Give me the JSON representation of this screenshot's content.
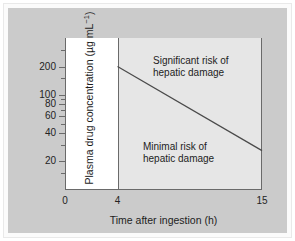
{
  "chart_data": {
    "type": "line",
    "title": "",
    "subtitle": "",
    "xlabel": "Time after ingestion (h)",
    "ylabel": "Plasma drug concentration (µg mL⁻¹)",
    "ylabel_plain": "Plasma drug concentration (ugmL-1)",
    "yscale": "log",
    "xscale": "linear",
    "xlim": [
      0,
      15
    ],
    "ylim": [
      10,
      400
    ],
    "grid": false,
    "legend": null,
    "xticks": [
      {
        "value": 0,
        "label": "0"
      },
      {
        "value": 4,
        "label": "4"
      },
      {
        "value": 15,
        "label": "15"
      }
    ],
    "yticks": [
      {
        "value": 200,
        "label": "200",
        "minor": false
      },
      {
        "value": 100,
        "label": "100",
        "minor": false
      },
      {
        "value": 80,
        "label": "80",
        "minor": false
      },
      {
        "value": 60,
        "label": "60",
        "minor": false
      },
      {
        "value": 40,
        "label": "40",
        "minor": false
      },
      {
        "value": 20,
        "label": "20",
        "minor": false
      },
      {
        "value": 300,
        "label": "",
        "minor": true
      },
      {
        "value": 150,
        "label": "",
        "minor": true
      },
      {
        "value": 90,
        "label": "",
        "minor": true
      },
      {
        "value": 70,
        "label": "",
        "minor": true
      },
      {
        "value": 50,
        "label": "",
        "minor": true
      },
      {
        "value": 30,
        "label": "",
        "minor": true
      },
      {
        "value": 15,
        "label": "",
        "minor": true
      }
    ],
    "series": [
      {
        "name": "Treatment / hepatotoxicity threshold line",
        "x": [
          4,
          15
        ],
        "y": [
          200,
          26
        ],
        "color": "#4a4a4a"
      }
    ],
    "regions": [
      {
        "name": "pre-4h-unshaded",
        "x_from": 0,
        "x_to": 4,
        "fill": "#ffffff"
      },
      {
        "name": "nomogram-shaded",
        "x_from": 4,
        "x_to": 15,
        "fill": "#e6e6e6"
      }
    ],
    "annotations": [
      {
        "name": "significant-risk",
        "line1": "Significant risk of",
        "line2": "hepatic damage",
        "position": "above-line"
      },
      {
        "name": "minimal-risk",
        "line1": "Minimal risk of",
        "line2": "hepatic damage",
        "position": "below-line"
      }
    ],
    "colors": {
      "page_background": "#ffffff",
      "card_background": "#cbcbcb",
      "plot_shaded": "#e6e6e6",
      "plot_unshaded": "#ffffff",
      "axis": "#6a6a6a",
      "line": "#4a4a4a",
      "text": "#1d1d1d"
    }
  }
}
